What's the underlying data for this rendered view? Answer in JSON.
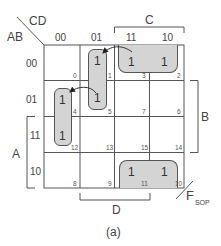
{
  "figure": {
    "caption": "(a)",
    "row_var_label": "AB",
    "col_var_label": "CD",
    "output_label": "F",
    "output_subscript": "SOP",
    "col_headers": [
      "00",
      "01",
      "11",
      "10"
    ],
    "row_headers": [
      "00",
      "01",
      "11",
      "10"
    ],
    "brackets": {
      "C": "C",
      "D": "D",
      "A": "A",
      "B": "B"
    },
    "cells": [
      {
        "index": "0",
        "value": ""
      },
      {
        "index": "1",
        "value": "1"
      },
      {
        "index": "3",
        "value": "1"
      },
      {
        "index": "2",
        "value": "1"
      },
      {
        "index": "4",
        "value": "1"
      },
      {
        "index": "5",
        "value": "1"
      },
      {
        "index": "7",
        "value": ""
      },
      {
        "index": "6",
        "value": ""
      },
      {
        "index": "12",
        "value": "1"
      },
      {
        "index": "13",
        "value": ""
      },
      {
        "index": "15",
        "value": ""
      },
      {
        "index": "14",
        "value": ""
      },
      {
        "index": "8",
        "value": ""
      },
      {
        "index": "9",
        "value": ""
      },
      {
        "index": "11",
        "value": "1"
      },
      {
        "index": "10",
        "value": "1"
      }
    ],
    "groups": [
      {
        "name": "top-row-group",
        "cells": [
          "3",
          "2"
        ]
      },
      {
        "name": "col01-group",
        "cells": [
          "1",
          "5"
        ]
      },
      {
        "name": "col00-group",
        "cells": [
          "4",
          "12"
        ]
      },
      {
        "name": "bottom-row-group",
        "cells": [
          "11",
          "10"
        ]
      }
    ],
    "colors": {
      "group_fill": "#d4d4d4",
      "line": "#555555"
    }
  }
}
